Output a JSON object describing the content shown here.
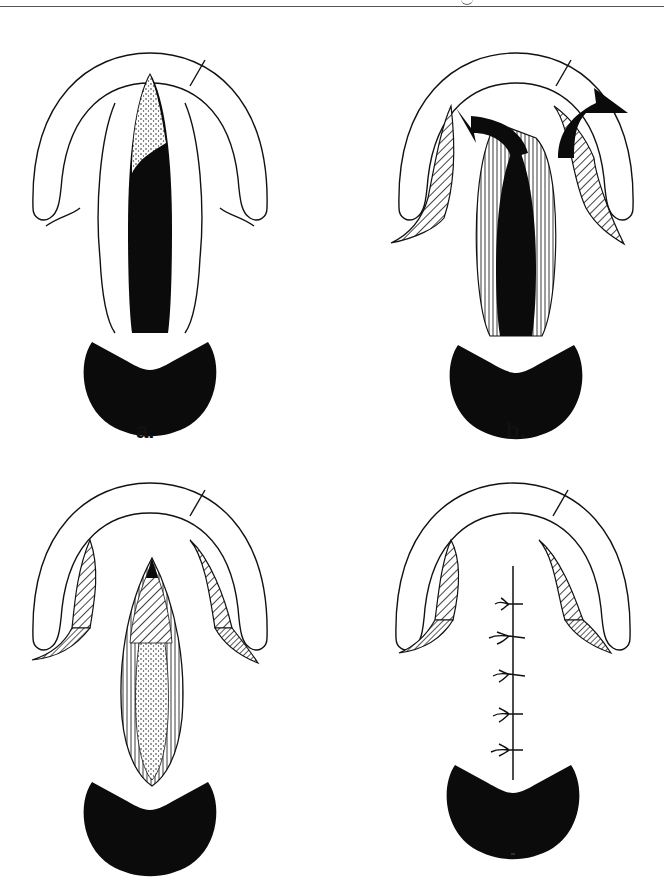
{
  "header": {
    "rule": "horizontal-rule",
    "cropped_glyph": "g"
  },
  "figure": {
    "panels": [
      {
        "id": "a",
        "label": "a.",
        "position": "top-left",
        "elements": [
          "arch",
          "incision-lines",
          "cleft-black-fill",
          "stippled-apex",
          "base-blob"
        ]
      },
      {
        "id": "b",
        "label": "b.",
        "position": "top-right",
        "elements": [
          "arch",
          "hatched-flaps",
          "arrow-left",
          "arrow-right",
          "striated-flaps",
          "base-blob"
        ]
      },
      {
        "id": "c",
        "label": "",
        "position": "bottom-left",
        "elements": [
          "arch",
          "hatched-flaps",
          "stippled-striated-closure",
          "base-blob"
        ]
      },
      {
        "id": "d",
        "label": "",
        "position": "bottom-right",
        "elements": [
          "arch",
          "hatched-flaps",
          "suture-line",
          "suture-knots",
          "base-blob"
        ]
      }
    ],
    "suture_knot_count": 5,
    "colors": {
      "ink": "#0b0b0b",
      "paper": "#ffffff"
    }
  }
}
